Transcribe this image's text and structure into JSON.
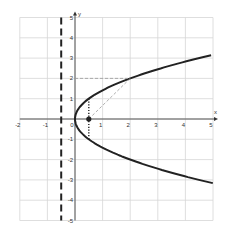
{
  "chart_data": {
    "type": "line",
    "title": "",
    "xlabel": "x",
    "ylabel": "y",
    "xlim": [
      -2,
      5
    ],
    "ylim": [
      -5,
      5
    ],
    "grid": true,
    "x_ticks": [
      "-2",
      "-1",
      "0",
      "1",
      "2",
      "3",
      "4",
      "5"
    ],
    "y_ticks": [
      "-5",
      "-4",
      "-3",
      "-2",
      "-1",
      "1",
      "2",
      "3",
      "4",
      "5"
    ],
    "series": [
      {
        "name": "parabola y^2 = 2x",
        "style": "solid-thick",
        "color": "#222222",
        "points": [
          [
            5,
            3.16
          ],
          [
            4,
            2.83
          ],
          [
            3,
            2.45
          ],
          [
            2,
            2
          ],
          [
            1,
            1.41
          ],
          [
            0.5,
            1
          ],
          [
            0.125,
            0.5
          ],
          [
            0,
            0
          ],
          [
            0.125,
            -0.5
          ],
          [
            0.5,
            -1
          ],
          [
            1,
            -1.41
          ],
          [
            2,
            -2
          ],
          [
            3,
            -2.45
          ],
          [
            4,
            -2.83
          ],
          [
            5,
            -3.16
          ]
        ]
      },
      {
        "name": "directrix x = -0.5",
        "style": "dashed-thick",
        "color": "#222222",
        "points": [
          [
            -0.5,
            5
          ],
          [
            -0.5,
            -5
          ]
        ]
      },
      {
        "name": "latus rectum x = 0.5",
        "style": "dotted",
        "color": "#222222",
        "points": [
          [
            0.5,
            1
          ],
          [
            0.5,
            -1
          ]
        ]
      },
      {
        "name": "focus to point",
        "style": "dashed-thin",
        "color": "#999999",
        "points": [
          [
            0.5,
            0
          ],
          [
            2,
            2
          ]
        ]
      },
      {
        "name": "horizontal to point",
        "style": "dashed-thin",
        "color": "#999999",
        "points": [
          [
            0,
            2
          ],
          [
            2,
            2
          ]
        ]
      }
    ],
    "annotations": [
      {
        "type": "point",
        "label": "focus",
        "x": 0.5,
        "y": 0
      }
    ]
  }
}
